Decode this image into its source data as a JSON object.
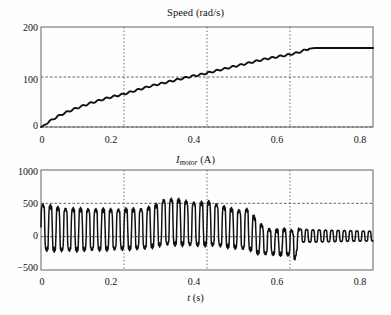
{
  "figure": {
    "background": "#fefefe",
    "line_color": "#111111",
    "axis_color": "#555555",
    "grid_color": "#555555"
  },
  "panels": [
    {
      "id": "speed",
      "title_parts": {
        "prefix": "Speed (rad/s)"
      },
      "title_plain": "Speed (rad/s)",
      "xlabel": "",
      "ylabel": "",
      "yticks": [
        "200",
        "100",
        "0"
      ],
      "xticks": [
        "0",
        "0.2",
        "0.4",
        "0.6",
        "0.8"
      ]
    },
    {
      "id": "current",
      "title_parts": {
        "symbol": "I",
        "subscript": "motor",
        "suffix": " (A)"
      },
      "title_plain": "I_motor (A)",
      "xlabel_parts": {
        "symbol": "t",
        "suffix": " (s)"
      },
      "xlabel_plain": "t (s)",
      "yticks": [
        "1000",
        "500",
        "0",
        "−500"
      ],
      "xticks": [
        "0",
        "0.2",
        "0.4",
        "0.6",
        "0.8"
      ]
    }
  ],
  "chart_data": [
    {
      "type": "line",
      "id": "speed-plot",
      "title": "Speed (rad/s)",
      "xlabel": "",
      "ylabel": "Speed (rad/s)",
      "xlim": [
        0,
        0.8
      ],
      "ylim": [
        0,
        200
      ],
      "xticks": [
        0,
        0.2,
        0.4,
        0.6,
        0.8
      ],
      "yticks": [
        0,
        100,
        200
      ],
      "grid": {
        "vertical": [
          0.2,
          0.4,
          0.6
        ],
        "horizontal": [
          100,
          0
        ],
        "style": "dotted"
      },
      "legend": null,
      "series": [
        {
          "name": "Speed",
          "x": [
            0,
            0.005,
            0.01,
            0.02,
            0.03,
            0.04,
            0.05,
            0.06,
            0.08,
            0.1,
            0.12,
            0.14,
            0.16,
            0.18,
            0.2,
            0.22,
            0.24,
            0.26,
            0.28,
            0.3,
            0.32,
            0.34,
            0.36,
            0.38,
            0.4,
            0.42,
            0.44,
            0.46,
            0.48,
            0.5,
            0.52,
            0.54,
            0.56,
            0.58,
            0.6,
            0.61,
            0.62,
            0.63,
            0.64,
            0.65,
            0.66,
            0.68,
            0.7,
            0.72,
            0.74,
            0.76,
            0.78,
            0.8
          ],
          "y": [
            0,
            2,
            5,
            11,
            16,
            21,
            25,
            29,
            36,
            42,
            48,
            53,
            58,
            62,
            66,
            71,
            76,
            81,
            85,
            89,
            93,
            97,
            101,
            104,
            108,
            112,
            116,
            120,
            124,
            128,
            132,
            136,
            139,
            142,
            145,
            147,
            149,
            152,
            155,
            157,
            158,
            158,
            158,
            158,
            158,
            158,
            158,
            158
          ]
        }
      ]
    },
    {
      "type": "line",
      "id": "current-plot",
      "title": "I_motor (A)",
      "xlabel": "t (s)",
      "ylabel": "I_motor (A)",
      "xlim": [
        0,
        0.8
      ],
      "ylim": [
        -500,
        1000
      ],
      "xticks": [
        0,
        0.2,
        0.4,
        0.6,
        0.8
      ],
      "yticks": [
        -500,
        0,
        500,
        1000
      ],
      "grid": {
        "vertical": [
          0.2,
          0.4,
          0.6
        ],
        "horizontal": [
          500,
          0
        ],
        "style": "dotted"
      },
      "legend": null,
      "description": "Motor current oscillates at roughly 55 Hz. Envelope peaks near +600/-350 A at t=0, decays slightly to +520/-300 by t=0.25, rises to about +700/-250 near t=0.30-0.33, falls after t=0.45, reaches a minimum of about -480 A near t=0.61, then settles to a small ripple of about +130/-110 A after t=0.63.",
      "envelope": {
        "t": [
          0.0,
          0.05,
          0.1,
          0.15,
          0.2,
          0.25,
          0.28,
          0.3,
          0.32,
          0.34,
          0.36,
          0.38,
          0.4,
          0.42,
          0.44,
          0.46,
          0.48,
          0.5,
          0.52,
          0.54,
          0.56,
          0.58,
          0.6,
          0.61,
          0.62,
          0.63,
          0.65,
          0.7,
          0.75,
          0.8
        ],
        "upper": [
          620,
          540,
          530,
          520,
          520,
          530,
          600,
          700,
          690,
          670,
          640,
          620,
          650,
          610,
          560,
          520,
          500,
          530,
          330,
          200,
          160,
          170,
          200,
          130,
          160,
          150,
          140,
          130,
          120,
          110
        ],
        "lower": [
          -330,
          -330,
          -320,
          -310,
          -300,
          -290,
          -260,
          -250,
          -250,
          -250,
          -250,
          -250,
          -250,
          -250,
          -260,
          -270,
          -290,
          -300,
          -340,
          -330,
          -330,
          -340,
          -350,
          -480,
          -160,
          -120,
          -120,
          -110,
          -100,
          -95
        ]
      }
    }
  ]
}
